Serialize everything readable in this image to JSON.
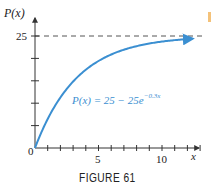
{
  "figure": {
    "caption": "FIGURE 61"
  },
  "chart_data": {
    "type": "line",
    "title": "",
    "xlabel": "x",
    "ylabel": "P(x)",
    "function": "P(x) = 25 - 25e^{-0.3x}",
    "annotation": {
      "text_main": "P(x) = 25 − 25e",
      "text_exponent": "−0.3x",
      "color": "#3b8fd1"
    },
    "asymptote": {
      "y": 25,
      "style": "dashed",
      "label": "25"
    },
    "x_ticks": [
      0,
      1,
      2,
      3,
      4,
      5,
      6,
      7,
      8,
      9,
      10,
      11,
      12,
      13
    ],
    "x_tick_labels": {
      "0": "0",
      "5": "5",
      "10": "10"
    },
    "y_ticks": [
      0,
      5,
      10,
      15,
      20,
      25
    ],
    "y_tick_labels": {
      "25": "25"
    },
    "xlim": [
      0,
      13.5
    ],
    "ylim": [
      0,
      27
    ],
    "grid": false,
    "x": [
      0,
      1,
      2,
      3,
      4,
      5,
      6,
      7,
      8,
      9,
      10,
      11,
      12,
      13
    ],
    "series": [
      {
        "name": "P(x)",
        "values": [
          0,
          6.48,
          11.28,
          14.84,
          17.47,
          19.42,
          20.87,
          21.94,
          22.73,
          23.32,
          23.76,
          24.08,
          24.32,
          24.49
        ],
        "color": "#3b8fd1"
      }
    ],
    "colors": {
      "curve": "#3b8fd1",
      "axes": "#333333",
      "asymptote": "#555555"
    }
  }
}
